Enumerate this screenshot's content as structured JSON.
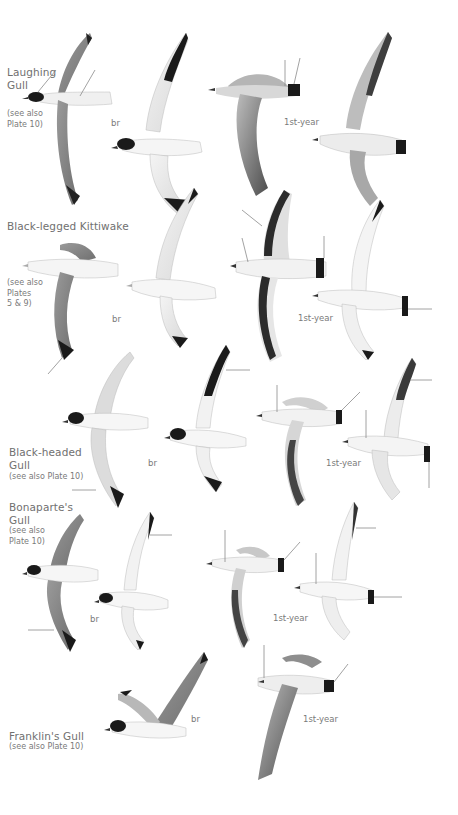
{
  "plate": {
    "species": [
      {
        "name": "Laughing Gull",
        "name_lines": [
          "Laughing",
          "Gull"
        ],
        "note_lines": [
          "(see also",
          "Plate 10)"
        ],
        "labels": [
          "br",
          "1st-year"
        ]
      },
      {
        "name": "Black-legged Kittiwake",
        "name_lines": [
          "Black-legged Kittiwake"
        ],
        "note_lines": [
          "(see also",
          "Plates",
          "5 & 9)"
        ],
        "labels": [
          "br",
          "1st-year"
        ]
      },
      {
        "name": "Black-headed Gull",
        "name_lines": [
          "Black-headed",
          "Gull"
        ],
        "note_lines": [
          "(see also Plate 10)"
        ],
        "labels": [
          "br",
          "1st-year"
        ]
      },
      {
        "name": "Bonaparte's Gull",
        "name_lines": [
          "Bonaparte's",
          "Gull"
        ],
        "note_lines": [
          "(see also",
          "Plate 10)"
        ],
        "labels": [
          "br",
          "1st-year"
        ]
      },
      {
        "name": "Franklin's Gull",
        "name_lines": [
          "Franklin's Gull"
        ],
        "note_lines": [
          "(see also Plate 10)"
        ],
        "labels": [
          "br",
          "1st-year"
        ]
      }
    ]
  },
  "icons": {
    "bird": "gull-illustration-icon"
  }
}
